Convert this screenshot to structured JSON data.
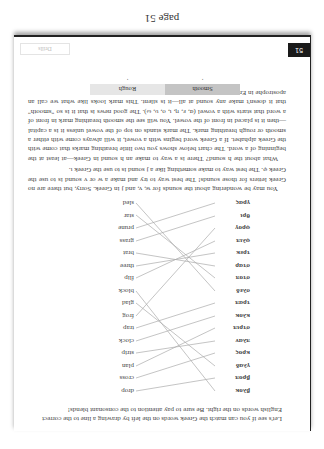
{
  "caption": "page 51",
  "page": {
    "number": "51",
    "section_label": "Drills",
    "intro": "Let's see if you can match the Greek words on the left by drawing a line to the correct English words on the right. Be sure to pay attention to the consonant blends!",
    "matching": {
      "greek": [
        "βλοκ",
        "βροπ",
        "γλαδ",
        "κρος",
        "πλαν",
        "στριπ",
        "κλοκ",
        "τραπ",
        "σλεδ",
        "στοπ",
        "σταρ",
        "τρεκ",
        "φλιπ",
        "φρογ",
        "θρι",
        "γρας"
      ],
      "english": [
        "drop",
        "cross",
        "plan",
        "strip",
        "clock",
        "trap",
        "frog",
        "glad",
        "block",
        "flip",
        "three",
        "brat",
        "grass",
        "prune",
        "star",
        "sled"
      ]
    },
    "paragraphs": [
      "You may be wondering about the sounds for w, v, and j in Greek. Sorry, but there are no Greek letters for those sounds! The best way to try and make a w or v sound is to use the Greek φ. The best way to make something like a j sound is to use the Greek ι.",
      "What about the h sound? There is a way to make an h sound in Greek—at least at the beginning of a word. The chart below shows you two little breathing marks that come with the Greek alphabet. If a Greek word begins with a vowel, it will always come with either a smooth or rough breathing mark. The mark stands on top of the vowel unless it is a capital—then it is placed in front of the vowel. You will see the smooth breathing mark in front of a word that starts with a vowel (α, ε, η, ι, ο, υ, ω). The good news is that it is so \"smooth\" that it doesn't make any sound at all—it is silent. This mark looks like what we call an apostrophe in English."
    ],
    "breathing_table": {
      "headers": [
        "Smooth",
        "Rough"
      ],
      "marks": [
        "᾿",
        "῾"
      ]
    }
  }
}
